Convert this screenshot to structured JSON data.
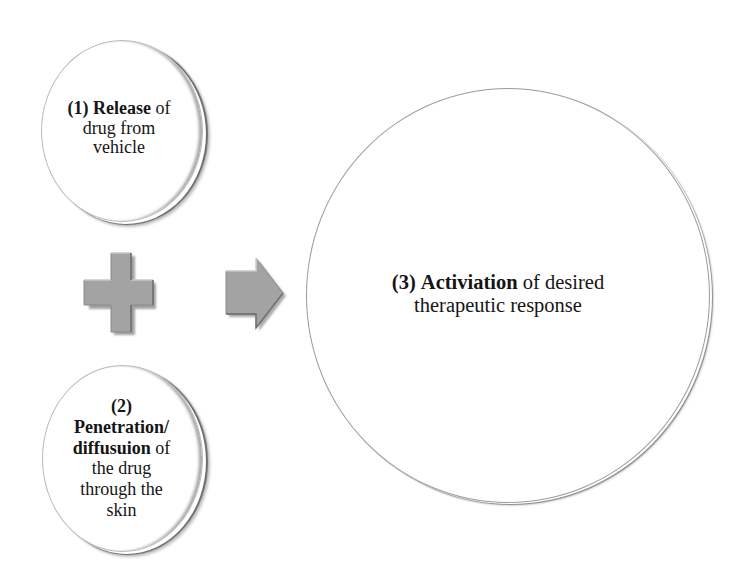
{
  "diagram": {
    "circle_1": {
      "number": "(1)",
      "bold": "Release",
      "rest_line1": " of",
      "line2": "drug from",
      "line3": "vehicle"
    },
    "circle_2": {
      "number": "(2)",
      "bold_line1": "Penetration/",
      "bold_line2": "diffusuion",
      "rest_line2": " of",
      "line3": "the drug",
      "line4": "through the",
      "line5": "skin"
    },
    "circle_3": {
      "number": "(3)",
      "bold": "Activiation",
      "rest_line1": " of desired",
      "line2": "therapeutic response"
    },
    "operators": {
      "plus": "plus-icon",
      "arrow": "arrow-right-icon"
    },
    "colors": {
      "shape_fill": "#a3a3a3",
      "shape_shadow": "#6e6e6e",
      "shape_highlight": "#e6e6e6",
      "circle_rim": "#8f8f8f",
      "text": "#151515",
      "background": "#ffffff"
    }
  }
}
